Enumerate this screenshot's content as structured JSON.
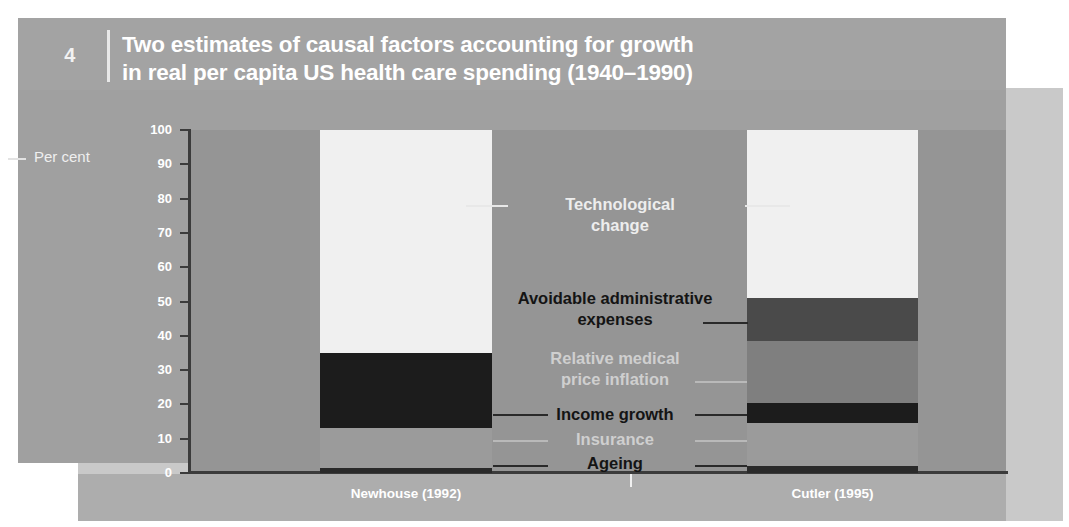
{
  "figure": {
    "number": "4",
    "title_line1": "Two estimates of causal factors accounting for growth",
    "title_line2": "in real per capita US health care spending (1940–1990)"
  },
  "axis": {
    "y_label": "Per cent",
    "y_ticks": [
      "100",
      "90",
      "80",
      "70",
      "60",
      "50",
      "40",
      "30",
      "20",
      "10",
      "0"
    ],
    "y_min": 0,
    "y_max": 100
  },
  "annotations": [
    {
      "id": "technological-change",
      "text_line1": "Technological",
      "text_line2": "change",
      "style": "light"
    },
    {
      "id": "avoidable-administrative-expenses",
      "text_line1": "Avoidable administrative",
      "text_line2": "expenses",
      "style": "dark"
    },
    {
      "id": "relative-medical-price-inflation",
      "text_line1": "Relative medical",
      "text_line2": "price inflation",
      "style": "mid"
    },
    {
      "id": "income-growth",
      "text_line1": "Income growth",
      "text_line2": "",
      "style": "dark"
    },
    {
      "id": "insurance",
      "text_line1": "Insurance",
      "text_line2": "",
      "style": "mid"
    },
    {
      "id": "ageing",
      "text_line1": "Ageing",
      "text_line2": "",
      "style": "dark"
    }
  ],
  "colors": {
    "page_background": "#ffffff",
    "panel_main": "#a0a0a0",
    "panel_outer": "#c9c9c9",
    "plot_background": "#959595",
    "technological_change": "#f0f0f0",
    "avoidable_administrative_expenses": "#4a4a4a",
    "relative_medical_price_inflation": "#7f7f7f",
    "income_growth": "#1c1c1c",
    "insurance": "#9b9b9b",
    "ageing": "#2a2a2a",
    "axis": "#3b3b3b"
  },
  "chart_data": {
    "type": "bar",
    "title": "Two estimates of causal factors accounting for growth in real per capita US health care spending (1940–1990)",
    "xlabel": "",
    "ylabel": "Per cent",
    "ylim": [
      0,
      100
    ],
    "stacked": true,
    "grid": false,
    "legend": "inline-annotations",
    "categories": [
      "Newhouse (1992)",
      "Cutler (1995)"
    ],
    "series": [
      {
        "name": "Ageing",
        "values": [
          1.5,
          2.0
        ]
      },
      {
        "name": "Insurance",
        "values": [
          11.5,
          12.5
        ]
      },
      {
        "name": "Income growth",
        "values": [
          22.0,
          6.0
        ]
      },
      {
        "name": "Relative medical price inflation",
        "values": [
          0,
          18.0
        ]
      },
      {
        "name": "Avoidable administrative expenses",
        "values": [
          0,
          12.5
        ]
      },
      {
        "name": "Technological change",
        "values": [
          65.0,
          49.0
        ]
      }
    ]
  }
}
